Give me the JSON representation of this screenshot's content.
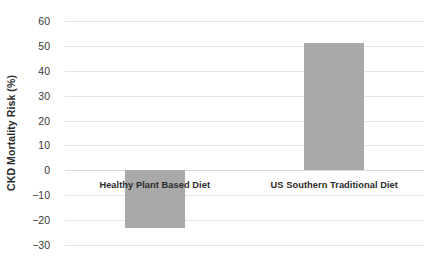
{
  "chart_data": {
    "type": "bar",
    "title": "",
    "xlabel": "",
    "ylabel": "CKD Mortality Risk (%)",
    "categories": [
      "Healthy Plant Based Diet",
      "US Southern Traditional Diet"
    ],
    "values": [
      -23,
      51
    ],
    "ylim": [
      -30,
      60
    ],
    "ytick_step": 10,
    "yticks": [
      60,
      50,
      40,
      30,
      20,
      10,
      0,
      -10,
      -20,
      -30
    ],
    "ytick_labels": [
      "60",
      "50",
      "40",
      "30",
      "20",
      "10",
      "0",
      "−10",
      "−20",
      "−30"
    ],
    "grid": true,
    "grid_axis": "y",
    "legend": false,
    "legend_position": "none",
    "series": [
      {
        "name": "CKD Mortality Risk",
        "values": [
          -23,
          51
        ],
        "color": "#a9a9a9"
      }
    ],
    "annotations": []
  },
  "colors": {
    "bar_fill": "#a9a9a9",
    "gridline": "#e3e3e3",
    "zero_line": "#dcdcdc",
    "tick_text": "#39393a",
    "label_text": "#2b2b2b",
    "background": "#ffffff"
  }
}
